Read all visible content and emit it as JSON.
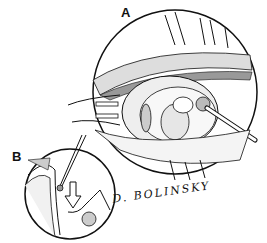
{
  "figure": {
    "panels": [
      {
        "label": "A",
        "description": "Magnified circular inset showing surgical field with retractor, tissue layers and instrument"
      },
      {
        "label": "B",
        "description": "Smaller circular inset showing cross-section with needle and downward arrow"
      }
    ],
    "signature": "D. BOLINSKY",
    "colors": {
      "line": "#111111",
      "background": "#ffffff"
    }
  }
}
